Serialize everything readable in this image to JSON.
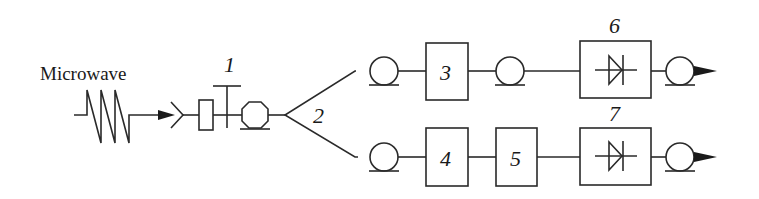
{
  "diagram": {
    "input_label": "Microwave",
    "labels": {
      "attenuator": "1",
      "splitter": "2",
      "component_3": "3",
      "component_4": "4",
      "component_5": "5",
      "detector_6": "6",
      "detector_7": "7"
    },
    "icons": {
      "microwave_wave": "zigzag-wave",
      "antenna": "antenna-chevron",
      "fiber_coil": "fiber-spool-circle",
      "detector": "photodiode-symbol",
      "output": "arrowhead"
    },
    "colors": {
      "stroke": "#2a2a2a",
      "background": "#ffffff"
    }
  }
}
